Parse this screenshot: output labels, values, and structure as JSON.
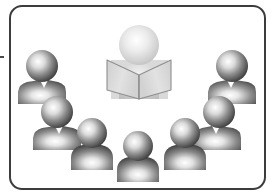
{
  "illustration": {
    "title": "Meeting Presentation Icon",
    "description": "Grayscale clipart of a presenter behind an open book facing an audience of eight seated people arranged in a U-shaped arc",
    "alt_text": "Presenter with open book addressing an audience"
  },
  "frame": {
    "name": "rounded-border-frame",
    "stroke_color": "#3c3c3c",
    "stroke_width": 2,
    "corner_radius": 12,
    "background_color": "#ffffff",
    "x": 9,
    "y": 5,
    "width": 256,
    "height": 185
  },
  "margin_mark": {
    "name": "left-margin-tick",
    "color": "#4a4a4a",
    "x": 0,
    "y": 56,
    "width": 4,
    "height": 2
  },
  "palette": {
    "audience_dark": "#343434",
    "audience_mid": "#6e6e6e",
    "audience_highlight": "#ffffff",
    "presenter_light": "#c9c9c9",
    "presenter_highlight": "#ffffff",
    "book_panel": "#dedede",
    "book_panel_shade": "#c4c4c4",
    "book_outline": "#8a8a8a",
    "backdrop": "#d8d8d8",
    "background": "#ffffff"
  },
  "presenter": {
    "name": "presenter-figure",
    "label": "Presenter",
    "head_cx": 139,
    "head_cy": 45,
    "head_r": 20,
    "body_x": 139,
    "body_y": 100,
    "fill": "#c9c9c9"
  },
  "book": {
    "name": "open-book",
    "label": "Open book",
    "center_x": 139,
    "top_y": 58,
    "bottom_y": 99,
    "half_width": 32,
    "panel_fill": "#dedede",
    "outline": "#8a8a8a"
  },
  "audience": {
    "count": 8,
    "label": "Audience",
    "figures": [
      {
        "name": "audience-figure-back-left",
        "position": "back-left",
        "head_cx": 42,
        "head_cy": 66,
        "head_r": 16,
        "shoulder_style": "angular",
        "shoulder_w": 48,
        "shoulder_h": 24,
        "shoulder_y": 88
      },
      {
        "name": "audience-figure-back-right",
        "position": "back-right",
        "head_cx": 232,
        "head_cy": 66,
        "head_r": 16,
        "shoulder_style": "angular",
        "shoulder_w": 48,
        "shoulder_h": 24,
        "shoulder_y": 88,
        "mirrored": true
      },
      {
        "name": "audience-figure-mid-left",
        "position": "mid-left",
        "head_cx": 57,
        "head_cy": 112,
        "head_r": 16,
        "shoulder_style": "angular",
        "shoulder_w": 48,
        "shoulder_h": 24,
        "shoulder_y": 134
      },
      {
        "name": "audience-figure-mid-right",
        "position": "mid-right",
        "head_cx": 219,
        "head_cy": 112,
        "head_r": 16,
        "shoulder_style": "angular",
        "shoulder_w": 48,
        "shoulder_h": 24,
        "shoulder_y": 134,
        "mirrored": true
      },
      {
        "name": "audience-figure-front-left",
        "position": "front-left",
        "head_cx": 92,
        "head_cy": 133,
        "head_r": 15,
        "shoulder_style": "rounded",
        "shoulder_w": 42,
        "shoulder_h": 24,
        "shoulder_y": 153
      },
      {
        "name": "audience-figure-front-right",
        "position": "front-right",
        "head_cx": 185,
        "head_cy": 133,
        "head_r": 15,
        "shoulder_style": "rounded",
        "shoulder_w": 42,
        "shoulder_h": 24,
        "shoulder_y": 153
      },
      {
        "name": "audience-figure-front-center",
        "position": "front-center",
        "head_cx": 138,
        "head_cy": 146,
        "head_r": 15,
        "shoulder_style": "rounded",
        "shoulder_w": 42,
        "shoulder_h": 24,
        "shoulder_y": 166
      },
      {
        "name": "audience-figure-mid-left-inner",
        "position": "mid-left-inner",
        "head_cx": 57,
        "head_cy": 112,
        "head_r": 0,
        "shoulder_style": "none",
        "shoulder_w": 0,
        "shoulder_h": 0,
        "shoulder_y": 0
      }
    ]
  }
}
